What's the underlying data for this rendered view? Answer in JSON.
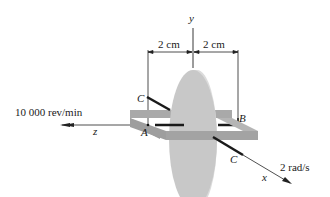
{
  "figure": {
    "axes": {
      "x": "x",
      "y": "y",
      "z": "z"
    },
    "dimensions": [
      {
        "label": "2 cm"
      },
      {
        "label": "2 cm"
      }
    ],
    "points": {
      "A": "A",
      "B": "B",
      "C_top": "C",
      "C_bottom": "C"
    },
    "spin_rate": "10 000 rev/min",
    "precession_rate": "2 rad/s"
  },
  "colors": {
    "disk_face": "#c8c8c8",
    "disk_rim": "#dcdcdc",
    "frame": "#a9a9a9",
    "frame_dark": "#8f8f8f",
    "shaft": "#1a1a1a",
    "lines": "#222222"
  }
}
